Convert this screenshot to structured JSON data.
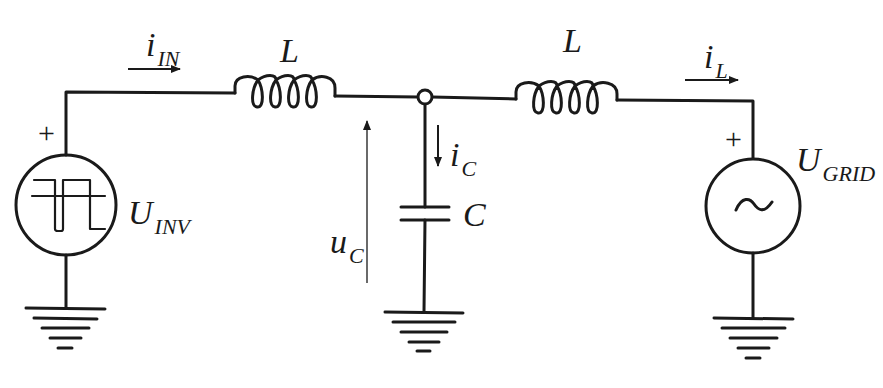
{
  "diagram": {
    "type": "LCL filter circuit",
    "stroke_color": "#1a1a1a",
    "background": "#ffffff",
    "labels": {
      "i_in": {
        "main": "i",
        "sub": "IN"
      },
      "l1": {
        "main": "L",
        "sub": ""
      },
      "l2": {
        "main": "L",
        "sub": ""
      },
      "i_l": {
        "main": "i",
        "sub": "L"
      },
      "u_inv": {
        "main": "U",
        "sub": "INV"
      },
      "u_grid": {
        "main": "U",
        "sub": "GRID"
      },
      "i_c": {
        "main": "i",
        "sub": "C"
      },
      "u_c": {
        "main": "u",
        "sub": "C"
      },
      "c": {
        "main": "C",
        "sub": ""
      }
    },
    "polarity": {
      "inv_plus": "+",
      "grid_plus": "+"
    },
    "components": [
      {
        "id": "inverter-source",
        "kind": "square-wave voltage source",
        "label": "U_INV"
      },
      {
        "id": "inductor-1",
        "kind": "inductor",
        "label": "L"
      },
      {
        "id": "capacitor",
        "kind": "capacitor",
        "label": "C"
      },
      {
        "id": "inductor-2",
        "kind": "inductor",
        "label": "L"
      },
      {
        "id": "grid-source",
        "kind": "AC voltage source",
        "label": "U_GRID",
        "symbol": "~"
      },
      {
        "id": "ground-1",
        "kind": "ground"
      },
      {
        "id": "ground-2",
        "kind": "ground"
      },
      {
        "id": "ground-3",
        "kind": "ground"
      }
    ],
    "ac_symbol": "~"
  }
}
